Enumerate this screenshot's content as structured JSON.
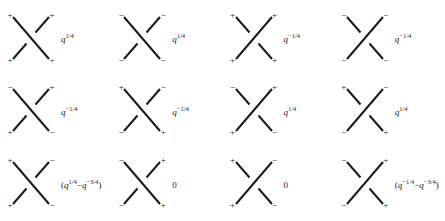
{
  "figure": {
    "kind": "knot-crossing-sign-table",
    "columns": 4,
    "rows": 3,
    "stroke_color": "#1a1a1a",
    "background_color": "#ffffff",
    "cells": [
      {
        "id": "r1c1",
        "crossing": "over-nwse",
        "signs": {
          "nw": "+",
          "ne": "+",
          "sw": "+",
          "se": "+"
        },
        "label": {
          "base": "q",
          "exponent": "1/4",
          "text": "q^{1/4}"
        }
      },
      {
        "id": "r1c2",
        "crossing": "over-nwse",
        "signs": {
          "nw": "−",
          "ne": "−",
          "sw": "−",
          "se": "−"
        },
        "label": {
          "base": "q",
          "exponent": "1/4",
          "text": "q^{1/4}"
        }
      },
      {
        "id": "r1c3",
        "crossing": "over-nesw",
        "signs": {
          "nw": "+",
          "ne": "+",
          "sw": "+",
          "se": "+"
        },
        "label": {
          "base": "q",
          "exponent": "−1/4",
          "text": "q^{-1/4}"
        }
      },
      {
        "id": "r1c4",
        "crossing": "over-nesw",
        "signs": {
          "nw": "−",
          "ne": "−",
          "sw": "−",
          "se": "−"
        },
        "label": {
          "base": "q",
          "exponent": "−1/4",
          "text": "q^{-1/4}"
        }
      },
      {
        "id": "r2c1",
        "crossing": "over-nwse",
        "signs": {
          "nw": "−",
          "ne": "+",
          "sw": "+",
          "se": "−"
        },
        "label": {
          "base": "q",
          "exponent": "−1/4",
          "text": "q^{-1/4}"
        }
      },
      {
        "id": "r2c2",
        "crossing": "over-nwse",
        "signs": {
          "nw": "+",
          "ne": "−",
          "sw": "−",
          "se": "+"
        },
        "label": {
          "base": "q",
          "exponent": "−1/4",
          "text": "q^{-1/4}"
        }
      },
      {
        "id": "r2c3",
        "crossing": "over-nesw",
        "signs": {
          "nw": "−",
          "ne": "+",
          "sw": "+",
          "se": "−"
        },
        "label": {
          "base": "q",
          "exponent": "1/4",
          "text": "q^{1/4}"
        }
      },
      {
        "id": "r2c4",
        "crossing": "over-nesw",
        "signs": {
          "nw": "+",
          "ne": "−",
          "sw": "−",
          "se": "+"
        },
        "label": {
          "base": "q",
          "exponent": "1/4",
          "text": "q^{1/4}"
        }
      },
      {
        "id": "r3c1",
        "crossing": "over-nwse",
        "signs": {
          "nw": "+",
          "ne": "−",
          "sw": "+",
          "se": "−"
        },
        "label": {
          "expression": true,
          "open": "(",
          "term1_base": "q",
          "term1_exponent": "1/4",
          "operator": "−",
          "term2_base": "q",
          "term2_exponent": "−3/4",
          "close": ")",
          "text": "(q^{1/4} − q^{-3/4})"
        }
      },
      {
        "id": "r3c2",
        "crossing": "over-nwse",
        "signs": {
          "nw": "−",
          "ne": "+",
          "sw": "−",
          "se": "+"
        },
        "label": {
          "plain": "0",
          "text": "0"
        }
      },
      {
        "id": "r3c3",
        "crossing": "over-nesw",
        "signs": {
          "nw": "+",
          "ne": "−",
          "sw": "+",
          "se": "−"
        },
        "label": {
          "plain": "0",
          "text": "0"
        }
      },
      {
        "id": "r3c4",
        "crossing": "over-nesw",
        "signs": {
          "nw": "−",
          "ne": "+",
          "sw": "−",
          "se": "+"
        },
        "label": {
          "expression": true,
          "open": "(",
          "term1_base": "q",
          "term1_exponent": "−1/4",
          "operator": "−",
          "term2_base": "q",
          "term2_exponent": "−3/4",
          "close": ")",
          "text": "(q^{-1/4} − q^{-3/4})"
        }
      }
    ]
  }
}
